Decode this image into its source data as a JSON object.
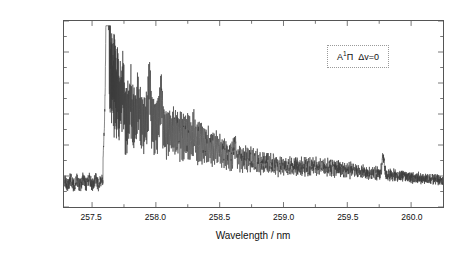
{
  "chart_data": {
    "type": "line",
    "title": "",
    "subtitle": "",
    "xlabel": "Wavelength / nm",
    "ylabel": "Absorbance",
    "xlim": [
      257.28,
      260.25
    ],
    "ylim": [
      0.004,
      0.016
    ],
    "xticks": [
      257.5,
      258.0,
      258.5,
      259.0,
      259.5,
      260.0
    ],
    "xticklabels": [
      "257.5",
      "258.0",
      "258.5",
      "259.0",
      "259.5",
      "260.0"
    ],
    "yticks": [
      0.004,
      0.006,
      0.008,
      0.01,
      0.012,
      0.014,
      0.016
    ],
    "yticklabels": [
      "0.004",
      "0.006",
      "0.008",
      "0.010",
      "0.012",
      "0.014",
      "0.016"
    ],
    "minor_ticks_per_interval": 1,
    "grid": false,
    "legend_position": "upper-right",
    "line_color": "#3a3a3a",
    "line_width": 0.6,
    "frame": "full-box",
    "tick_direction": "in",
    "annotations": [
      {
        "text_plain": "A 1Π  Δv=0",
        "state_letter": "A",
        "multiplicity": "1",
        "term_symbol": "Π",
        "vibrational_label": "Δv=0",
        "position": "upper-right",
        "box_border_style": "dotted",
        "box_border_color": "#9a9a9a"
      }
    ],
    "series": [
      {
        "name": "absorption-spectrum",
        "description": "A 1-Pi delta-v=0 band system; sharp bandhead near 257.6 nm followed by dense rotational structure decaying to baseline",
        "baseline_before_head": 0.0056,
        "bandhead_wavelength": 257.62,
        "bandhead_peak": 0.0153,
        "secondary_peaks": [
          {
            "x": 257.74,
            "y": 0.0132
          },
          {
            "x": 257.8,
            "y": 0.0124
          },
          {
            "x": 257.86,
            "y": 0.0122
          },
          {
            "x": 257.95,
            "y": 0.0134
          },
          {
            "x": 258.04,
            "y": 0.0125
          },
          {
            "x": 258.3,
            "y": 0.0101
          },
          {
            "x": 258.62,
            "y": 0.0091
          },
          {
            "x": 259.78,
            "y": 0.0077
          }
        ],
        "envelope_points": [
          {
            "x": 257.28,
            "y": 0.0056
          },
          {
            "x": 257.55,
            "y": 0.0057
          },
          {
            "x": 257.62,
            "y": 0.0153
          },
          {
            "x": 257.75,
            "y": 0.011
          },
          {
            "x": 258.0,
            "y": 0.0105
          },
          {
            "x": 258.3,
            "y": 0.0096
          },
          {
            "x": 258.6,
            "y": 0.0082
          },
          {
            "x": 259.0,
            "y": 0.0072
          },
          {
            "x": 259.3,
            "y": 0.0073
          },
          {
            "x": 259.7,
            "y": 0.0066
          },
          {
            "x": 260.25,
            "y": 0.0058
          }
        ]
      }
    ]
  },
  "axes": {
    "y_title": "Absorbance",
    "x_title": "Wavelength / nm"
  },
  "annotation": {
    "state_letter": "A",
    "multiplicity": "1",
    "term_symbol": "Π",
    "delta_v": "Δv=0"
  }
}
